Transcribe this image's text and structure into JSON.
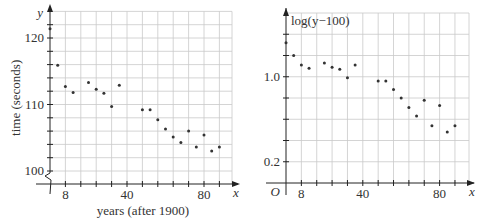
{
  "chart_data": [
    {
      "type": "scatter",
      "title": "",
      "xlabel": "years (after 1900)",
      "ylabel": "time (seconds)",
      "x_axis_symbol": "x",
      "y_axis_symbol": "y",
      "xlim": [
        0,
        94
      ],
      "ylim": [
        98,
        124
      ],
      "y_axis_break": true,
      "grid": true,
      "x_grid_step": 8,
      "y_grid_step": 2,
      "x_tick_labels": [
        {
          "value": 8,
          "label": "8"
        },
        {
          "value": 40,
          "label": "40"
        },
        {
          "value": 80,
          "label": "80"
        }
      ],
      "y_tick_labels": [
        {
          "value": 100,
          "label": "100"
        },
        {
          "value": 110,
          "label": "110"
        },
        {
          "value": 120,
          "label": "120"
        }
      ],
      "x": [
        0,
        4,
        8,
        12,
        20,
        24,
        28,
        32,
        36,
        48,
        52,
        56,
        60,
        64,
        68,
        72,
        76,
        80,
        84,
        88
      ],
      "y": [
        121.4,
        115.9,
        112.7,
        111.8,
        113.3,
        112.3,
        111.7,
        109.7,
        112.9,
        109.2,
        109.2,
        107.7,
        106.3,
        105.1,
        104.3,
        106.0,
        103.6,
        105.4,
        103.0,
        103.6
      ]
    },
    {
      "type": "scatter",
      "title": "",
      "xlabel": "",
      "ylabel": "log(y−100)",
      "x_axis_symbol": "x",
      "origin_label": "O",
      "xlim": [
        0,
        95
      ],
      "ylim": [
        0,
        1.6
      ],
      "grid": true,
      "x_grid_step": 8,
      "y_grid_step": 0.2,
      "x_tick_labels": [
        {
          "value": 8,
          "label": "8"
        },
        {
          "value": 40,
          "label": "40"
        },
        {
          "value": 80,
          "label": "80"
        }
      ],
      "y_tick_labels": [
        {
          "value": 0.2,
          "label": "0.2"
        },
        {
          "value": 1.0,
          "label": "1.0"
        }
      ],
      "x": [
        0,
        4,
        8,
        12,
        20,
        24,
        28,
        32,
        36,
        48,
        52,
        56,
        60,
        64,
        68,
        72,
        76,
        80,
        84,
        88
      ],
      "y": [
        1.32,
        1.2,
        1.11,
        1.08,
        1.13,
        1.09,
        1.07,
        0.99,
        1.11,
        0.96,
        0.96,
        0.88,
        0.8,
        0.71,
        0.63,
        0.78,
        0.54,
        0.73,
        0.48,
        0.54
      ]
    }
  ]
}
